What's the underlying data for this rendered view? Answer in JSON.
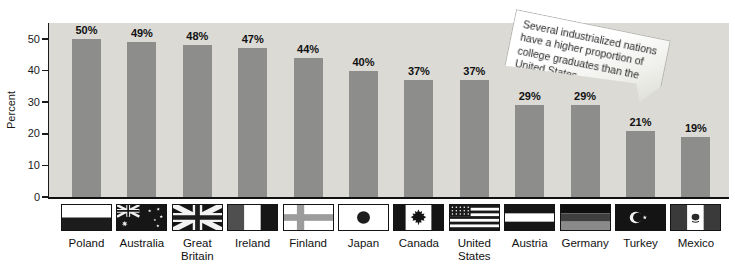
{
  "chart_data": {
    "type": "bar",
    "title": "",
    "xlabel": "",
    "ylabel": "Percent",
    "ylim": [
      0,
      55
    ],
    "yticks": [
      0,
      10,
      20,
      30,
      40,
      50
    ],
    "grid": false,
    "legend": null,
    "categories": [
      "Poland",
      "Australia",
      "Great Britain",
      "Ireland",
      "Finland",
      "Japan",
      "Canada",
      "United States",
      "Austria",
      "Germany",
      "Turkey",
      "Mexico"
    ],
    "values": [
      50,
      49,
      48,
      47,
      44,
      40,
      37,
      37,
      29,
      29,
      21,
      19
    ],
    "value_labels": [
      "50%",
      "49%",
      "48%",
      "47%",
      "44%",
      "40%",
      "37%",
      "37%",
      "29%",
      "29%",
      "21%",
      "19%"
    ],
    "flag_icons": [
      "poland-flag-icon",
      "australia-flag-icon",
      "great-britain-flag-icon",
      "ireland-flag-icon",
      "finland-flag-icon",
      "japan-flag-icon",
      "canada-flag-icon",
      "united-states-flag-icon",
      "austria-flag-icon",
      "germany-flag-icon",
      "turkey-flag-icon",
      "mexico-flag-icon"
    ],
    "annotation": "Several industrialized nations have a higher proportion of college graduates than the United States.",
    "bar_color": "#8d8d8b",
    "plot_background": "#dbdad5",
    "axis_color": "#1a1a1a",
    "text_color": "#111111"
  }
}
